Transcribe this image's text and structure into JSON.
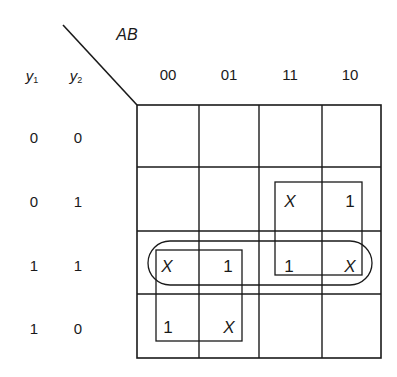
{
  "map": {
    "column_variable_label": "AB",
    "row_variable_labels": [
      "y",
      "y"
    ],
    "row_variable_subscripts": [
      "1",
      "2"
    ],
    "column_headers": [
      "00",
      "01",
      "11",
      "10"
    ],
    "row_headers": [
      {
        "y1": "0",
        "y2": "0"
      },
      {
        "y1": "0",
        "y2": "1"
      },
      {
        "y1": "1",
        "y2": "1"
      },
      {
        "y1": "1",
        "y2": "0"
      }
    ],
    "cells": [
      [
        "",
        "",
        "",
        ""
      ],
      [
        "",
        "",
        "X",
        "1"
      ],
      [
        "X",
        "1",
        "1",
        "X"
      ],
      [
        "1",
        "X",
        "",
        ""
      ]
    ],
    "groupings": [
      {
        "shape": "rectangle",
        "covers": "rows 01-11, cols 11-10"
      },
      {
        "shape": "rectangle",
        "covers": "rows 11-10, cols 00-01"
      },
      {
        "shape": "rounded-loop",
        "covers": "row 11, cols 00-10"
      }
    ],
    "line_color": "#1a1a1a"
  }
}
